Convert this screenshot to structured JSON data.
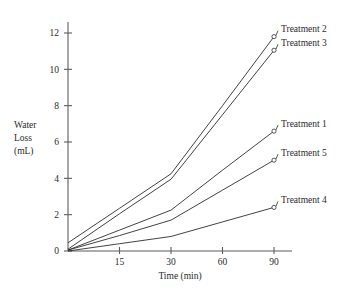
{
  "chart_data": {
    "type": "line",
    "title": "",
    "xlabel": "Time (min)",
    "ylabel": "Water Loss (mL)",
    "ylabel_lines": [
      "Water",
      "Loss",
      "(mL)"
    ],
    "x": [
      0,
      15,
      30,
      60,
      90
    ],
    "xtick_labels": [
      "15",
      "30",
      "60",
      "90"
    ],
    "xtick_values": [
      15,
      30,
      60,
      90
    ],
    "ytick_labels": [
      "0",
      "2",
      "4",
      "6",
      "8",
      "10",
      "12"
    ],
    "ytick_values": [
      0,
      2,
      4,
      6,
      8,
      10,
      12
    ],
    "ylim": [
      0,
      12.6
    ],
    "xlim_index": [
      0,
      4.6
    ],
    "grid": false,
    "legend_position": "right-inline-labels",
    "marker": "open-circle",
    "line_color": "#2e2e2e",
    "axis_color": "#5d5d5d",
    "text_color": "#2b2b2b",
    "background": "#ffffff",
    "series": [
      {
        "name": "Treatment 2",
        "label": "Treatment 2",
        "values": [
          0.45,
          2.35,
          4.25,
          8.0,
          11.8
        ],
        "endpoint": 11.8
      },
      {
        "name": "Treatment 3",
        "label": "Treatment 3",
        "values": [
          0.1,
          2.05,
          3.95,
          7.5,
          11.05
        ],
        "endpoint": 11.05
      },
      {
        "name": "Treatment 1",
        "label": "Treatment 1",
        "values": [
          0.05,
          1.15,
          2.25,
          4.45,
          6.6
        ],
        "endpoint": 6.6
      },
      {
        "name": "Treatment 5",
        "label": "Treatment 5",
        "values": [
          0.05,
          0.85,
          1.7,
          3.35,
          5.0
        ],
        "endpoint": 5.0
      },
      {
        "name": "Treatment 4",
        "label": "Treatment 4",
        "values": [
          0.0,
          0.4,
          0.8,
          1.6,
          2.4
        ],
        "endpoint": 2.4
      }
    ]
  }
}
